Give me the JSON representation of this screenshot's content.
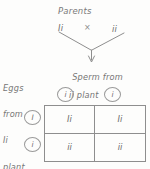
{
  "diagram": {
    "title": "Parents",
    "parents": {
      "left_genotype": "Ii",
      "cross_symbol": "×",
      "right_genotype": "ii"
    },
    "sperm_label": {
      "line1": "Sperm from",
      "line2": "ii plant"
    },
    "eggs_label": {
      "line1": "Eggs",
      "line2": "from",
      "line3": "Ii",
      "line4": "plant"
    },
    "column_gametes": [
      "i",
      "i"
    ],
    "row_gametes": [
      "I",
      "i"
    ],
    "offspring": [
      [
        "Ii",
        "Ii"
      ],
      [
        "ii",
        "ii"
      ]
    ],
    "colors": {
      "ink": "#6d6d6d",
      "line": "#8e8e8e",
      "paper": "#fdfdfc"
    }
  }
}
